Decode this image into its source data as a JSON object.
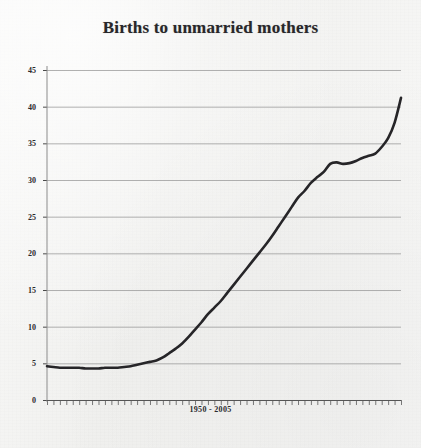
{
  "chart_data": {
    "type": "line",
    "title": "Births to unmarried mothers",
    "xlabel": "1950 - 2005",
    "ylabel": "",
    "xlim": [
      1950,
      2005
    ],
    "ylim": [
      0,
      45
    ],
    "grid": true,
    "legend": null,
    "yticks": [
      0,
      5,
      10,
      15,
      20,
      25,
      30,
      35,
      40,
      45
    ],
    "ytick_labels": [
      "0",
      "5",
      "10",
      "15",
      "20",
      "25",
      "30",
      "35",
      "40",
      "45"
    ],
    "xticks_minor_per_year": true,
    "line_color": "#262528",
    "series": [
      {
        "name": "Percent of births to unmarried mothers",
        "x": [
          1950,
          1951,
          1952,
          1953,
          1954,
          1955,
          1956,
          1957,
          1958,
          1959,
          1960,
          1961,
          1962,
          1963,
          1964,
          1965,
          1966,
          1967,
          1968,
          1969,
          1970,
          1971,
          1972,
          1973,
          1974,
          1975,
          1976,
          1977,
          1978,
          1979,
          1980,
          1981,
          1982,
          1983,
          1984,
          1985,
          1986,
          1987,
          1988,
          1989,
          1990,
          1991,
          1992,
          1993,
          1994,
          1995,
          1996,
          1997,
          1998,
          1999,
          2000,
          2001,
          2002,
          2003,
          2004,
          2005
        ],
        "values": [
          4.6,
          4.5,
          4.4,
          4.4,
          4.4,
          4.4,
          4.3,
          4.3,
          4.3,
          4.4,
          4.4,
          4.4,
          4.5,
          4.6,
          4.8,
          5.0,
          5.2,
          5.4,
          5.8,
          6.4,
          7.0,
          7.7,
          8.6,
          9.6,
          10.6,
          11.7,
          12.6,
          13.5,
          14.6,
          15.7,
          16.8,
          17.9,
          19.0,
          20.1,
          21.2,
          22.4,
          23.7,
          25.0,
          26.3,
          27.6,
          28.5,
          29.6,
          30.4,
          31.1,
          32.2,
          32.4,
          32.2,
          32.3,
          32.6,
          33.0,
          33.3,
          33.6,
          34.5,
          35.7,
          37.8,
          41.2
        ]
      }
    ]
  },
  "ytick_labels": [
    "45",
    "40",
    "35",
    "30",
    "25",
    "20",
    "15",
    "10",
    "5",
    "0"
  ]
}
